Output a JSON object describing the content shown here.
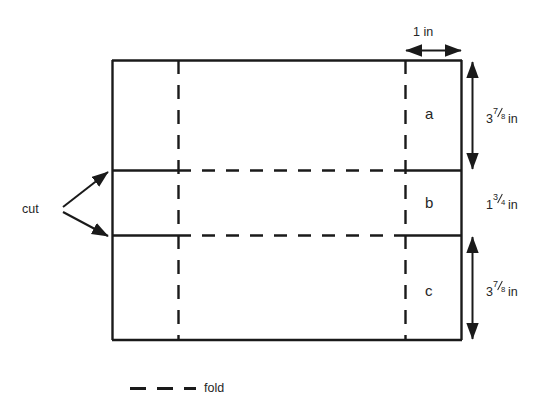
{
  "figure": {
    "stroke_color": "#1a1a1a",
    "background_color": "#ffffff"
  },
  "dimensions": {
    "top_width": {
      "text": "1 in",
      "value": 1,
      "unit": "in",
      "orientation": "horizontal"
    },
    "section_a_height": {
      "text": "3⅞ in",
      "whole": "3",
      "numerator": "7",
      "denominator": "8",
      "unit": "in",
      "orientation": "vertical"
    },
    "section_b_height": {
      "text": "1¾ in",
      "whole": "1",
      "numerator": "3",
      "denominator": "4",
      "unit": "in",
      "orientation": "vertical"
    },
    "section_c_height": {
      "text": "3⅞ in",
      "whole": "3",
      "numerator": "7",
      "denominator": "8",
      "unit": "in",
      "orientation": "vertical"
    }
  },
  "panels": {
    "a": "a",
    "b": "b",
    "c": "c"
  },
  "annotations": {
    "cut": "cut"
  },
  "legend": {
    "fold": "fold"
  }
}
